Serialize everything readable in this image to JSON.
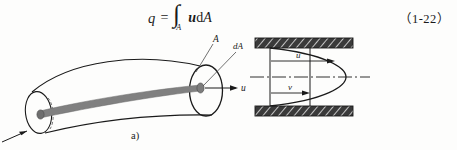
{
  "equation": {
    "lhs": "q",
    "equals": "=",
    "integral_symbol": "∫",
    "integral_subscript": "A",
    "integrand_variable": "u",
    "differential_d": "d",
    "differential_area": "A",
    "number": "（1-22）"
  },
  "figure_a": {
    "caption": "a)",
    "labels": {
      "area": "A",
      "element_area": "dA",
      "velocity": "u"
    },
    "colors": {
      "filament_fill": "#808080",
      "outline": "#1a1a1a"
    }
  },
  "figure_b": {
    "caption": "b)",
    "labels": {
      "velocity_top": "u",
      "velocity_bottom": "v"
    },
    "colors": {
      "wall_fill": "#3a3a3a",
      "outline": "#1a1a1a"
    }
  }
}
